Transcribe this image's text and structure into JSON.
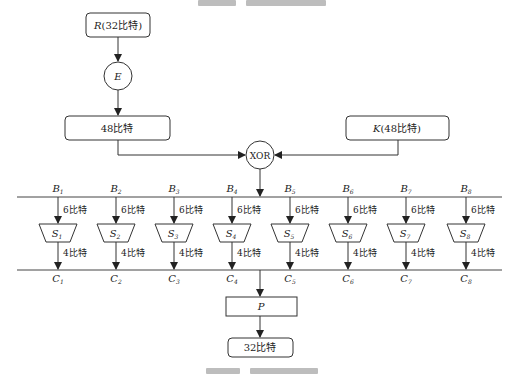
{
  "diagram": {
    "top_caption_clipped": true,
    "bottom_caption_clipped": true,
    "nodes": {
      "r_input": {
        "label_italic": "R",
        "label_rest": "(32比特)"
      },
      "expansion": {
        "label": "E"
      },
      "expanded": {
        "label": "48比特"
      },
      "key": {
        "label_italic": "K",
        "label_rest": "(48比特)"
      },
      "xor": {
        "label": "XOR"
      },
      "permutation": {
        "label": "P"
      },
      "output": {
        "label": "32比特"
      }
    },
    "sboxes": [
      {
        "in_label": "B",
        "in_sub": "1",
        "box_label": "S",
        "box_sub": "1",
        "out_label": "C",
        "out_sub": "1",
        "in_bits": "6比特",
        "out_bits": "4比特"
      },
      {
        "in_label": "B",
        "in_sub": "2",
        "box_label": "S",
        "box_sub": "2",
        "out_label": "C",
        "out_sub": "2",
        "in_bits": "6比特",
        "out_bits": "4比特"
      },
      {
        "in_label": "B",
        "in_sub": "3",
        "box_label": "S",
        "box_sub": "3",
        "out_label": "C",
        "out_sub": "3",
        "in_bits": "6比特",
        "out_bits": "4比特"
      },
      {
        "in_label": "B",
        "in_sub": "4",
        "box_label": "S",
        "box_sub": "4",
        "out_label": "C",
        "out_sub": "4",
        "in_bits": "6比特",
        "out_bits": "4比特"
      },
      {
        "in_label": "B",
        "in_sub": "5",
        "box_label": "S",
        "box_sub": "5",
        "out_label": "C",
        "out_sub": "5",
        "in_bits": "6比特",
        "out_bits": "4比特"
      },
      {
        "in_label": "B",
        "in_sub": "6",
        "box_label": "S",
        "box_sub": "6",
        "out_label": "C",
        "out_sub": "6",
        "in_bits": "6比特",
        "out_bits": "4比特"
      },
      {
        "in_label": "B",
        "in_sub": "7",
        "box_label": "S",
        "box_sub": "7",
        "out_label": "C",
        "out_sub": "7",
        "in_bits": "6比特",
        "out_bits": "4比特"
      },
      {
        "in_label": "B",
        "in_sub": "8",
        "box_label": "S",
        "box_sub": "8",
        "out_label": "C",
        "out_sub": "8",
        "in_bits": "6比特",
        "out_bits": "4比特"
      }
    ],
    "colors": {
      "stroke": "#333333",
      "text": "#222222",
      "background": "#ffffff"
    }
  }
}
